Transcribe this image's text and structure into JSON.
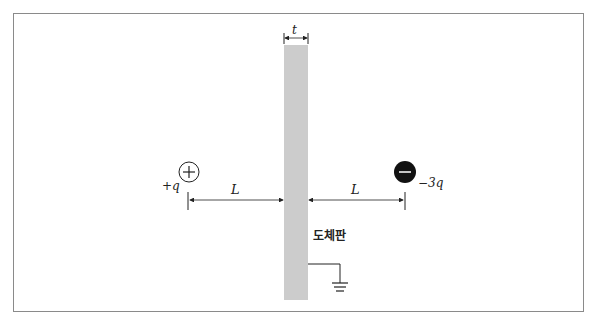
{
  "diagram": {
    "plate": {
      "label": "도체판",
      "thickness_label": "t",
      "color": "#cccccc"
    },
    "positive_charge": {
      "symbol": "+",
      "label": "+q"
    },
    "negative_charge": {
      "symbol": "−",
      "label": "−3q"
    },
    "distance_left": {
      "label": "L"
    },
    "distance_right": {
      "label": "L"
    },
    "ground": {
      "symbol": "ground"
    }
  }
}
